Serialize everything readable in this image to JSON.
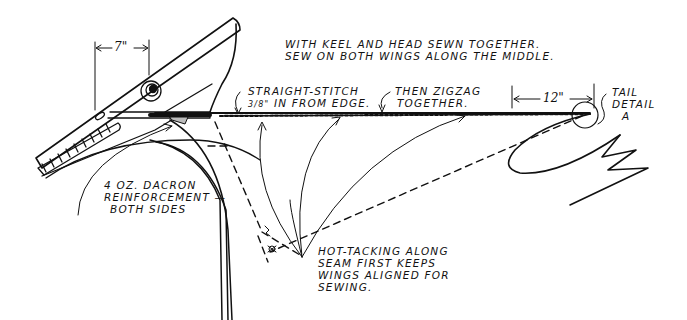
{
  "diagram": {
    "ink_color": "#111111",
    "background": "#ffffff"
  },
  "dimensions": {
    "head_width": "7\"",
    "tail_length": "12\""
  },
  "annotations": {
    "top_note": {
      "line1": "WITH KEEL AND HEAD SEWN TOGETHER.",
      "line2": "SEW ON BOTH WINGS ALONG THE MIDDLE."
    },
    "straight_stitch": {
      "line1": "STRAIGHT-STITCH",
      "line2_fraction": "3/8\"",
      "line2_rest": "IN FROM EDGE."
    },
    "zigzag": {
      "line1": "THEN ZIGZAG",
      "line2": "TOGETHER."
    },
    "tail_detail": {
      "line1": "TAIL",
      "line2": "DETAIL",
      "line3": "A"
    },
    "dacron": {
      "line1": "4 OZ. DACRON",
      "line2": "REINFORCEMENT —",
      "line3": "BOTH SIDES"
    },
    "hot_tacking": {
      "line1": "HOT-TACKING ALONG",
      "line2": "SEAM FIRST KEEPS",
      "line3": "WINGS ALIGNED FOR",
      "line4": "SEWING."
    }
  }
}
